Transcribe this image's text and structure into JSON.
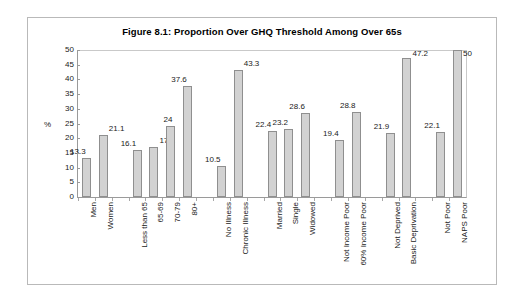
{
  "figure": {
    "title": "Figure 8.1: Proportion Over GHQ Threshold Among Over 65s"
  },
  "chart_data": {
    "type": "bar",
    "title": "Figure 8.1: Proportion Over GHQ Threshold Among Over 65s",
    "xlabel": "",
    "ylabel": "%",
    "ylim": [
      0,
      50
    ],
    "yticks": [
      "0",
      "5",
      "10",
      "15",
      "20",
      "25",
      "30",
      "35",
      "40",
      "45",
      "50"
    ],
    "grid": false,
    "legend": "none",
    "categories": [
      "Men",
      "Women",
      "Less than 65",
      "65-69",
      "70-79",
      "80+",
      "No Illness",
      "Chronic Illness",
      "Married",
      "Single",
      "Widowed",
      "Not Income Poor",
      "60% Income Poor",
      "Not Deprived",
      "Basic Deprivation",
      "Not Poor",
      "NAPS Poor"
    ],
    "values": [
      13.3,
      21.1,
      16.1,
      17.1,
      24,
      37.6,
      10.5,
      43.3,
      22.4,
      23.2,
      28.6,
      19.4,
      28.8,
      21.9,
      47.2,
      22.1,
      50
    ],
    "value_labels": [
      "13.3",
      "21.1",
      "16.1",
      "17.1",
      "24",
      "37.6",
      "10.5",
      "43.3",
      "22.4",
      "23.2",
      "28.6",
      "19.4",
      "28.8",
      "21.9",
      "47.2",
      "22.1",
      "50"
    ],
    "groups": [
      {
        "name": "Gender",
        "categories": [
          "Men",
          "Women"
        ]
      },
      {
        "name": "Age",
        "categories": [
          "Less than 65",
          "65-69",
          "70-79",
          "80+"
        ]
      },
      {
        "name": "Illness",
        "categories": [
          "No Illness",
          "Chronic Illness"
        ]
      },
      {
        "name": "Marital Status",
        "categories": [
          "Married",
          "Single",
          "Widowed"
        ]
      },
      {
        "name": "Income Poverty",
        "categories": [
          "Not Income Poor",
          "60% Income Poor"
        ]
      },
      {
        "name": "Deprivation",
        "categories": [
          "Not Deprived",
          "Basic Deprivation"
        ]
      },
      {
        "name": "NAPS Poverty",
        "categories": [
          "Not Poor",
          "NAPS Poor"
        ]
      }
    ],
    "colors": {
      "bar_fill": "#d2d2d2",
      "bar_border": "#8f8f8f",
      "axis": "#9a9a9a",
      "text": "#1a1a1a",
      "frame": "#b9b9b9",
      "background": "#ffffff"
    }
  }
}
